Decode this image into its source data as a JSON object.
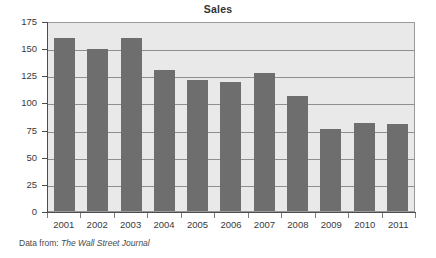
{
  "chart_data": {
    "type": "bar",
    "title": "Sales",
    "xlabel": "",
    "ylabel": "",
    "categories": [
      "2001",
      "2002",
      "2003",
      "2004",
      "2005",
      "2006",
      "2007",
      "2008",
      "2009",
      "2010",
      "2011"
    ],
    "values": [
      159,
      149,
      159,
      130,
      121,
      119,
      127,
      106,
      76,
      81,
      80
    ],
    "ylim": [
      0,
      175
    ],
    "yticks": [
      0,
      25,
      50,
      75,
      100,
      125,
      150,
      175
    ],
    "ytick_labels": [
      "0",
      "25",
      "50",
      "75",
      "100",
      "125",
      "150",
      "175"
    ],
    "grid": true,
    "grid_axis": "y",
    "legend": false,
    "bar_color": "#6e6e6e",
    "plot_background": "#e9e9e9",
    "figure_background": "#ffffff"
  },
  "caption": {
    "prefix": "Data from:",
    "source": "The Wall Street Journal"
  }
}
